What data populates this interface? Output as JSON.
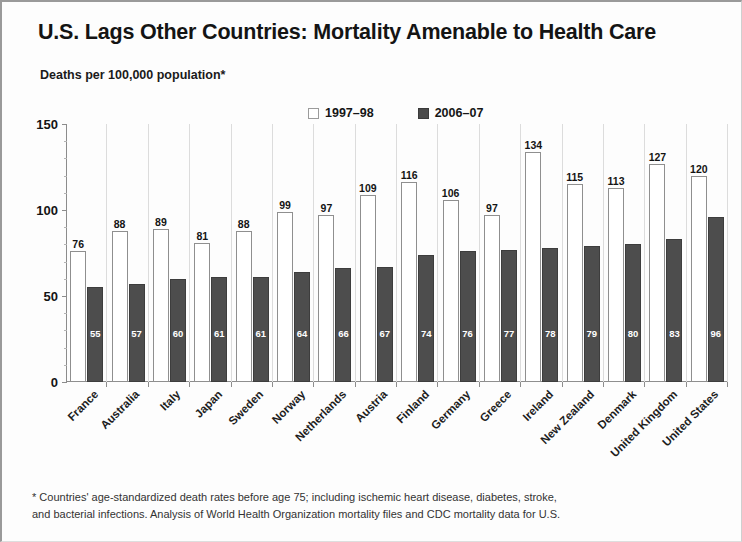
{
  "title": "U.S. Lags Other Countries: Mortality Amenable to Health Care",
  "axis_caption": "Deaths per 100,000 population*",
  "legend": {
    "items": [
      {
        "label": "1997–98",
        "swatch": "hollow-square-icon"
      },
      {
        "label": "2006–07",
        "swatch": "filled-square-icon"
      }
    ]
  },
  "footnote": {
    "line1": "* Countries' age-standardized death rates before age 75; including ischemic heart disease, diabetes, stroke,",
    "line2": "and bacterial infections. Analysis of World Health Organization mortality files and CDC mortality data for U.S."
  },
  "chart_data": {
    "type": "bar",
    "title": "U.S. Lags Other Countries: Mortality Amenable to Health Care",
    "subtitle": "Deaths per 100,000 population*",
    "xlabel": "",
    "ylabel": "Deaths per 100,000 population*",
    "ylim": [
      0,
      150
    ],
    "yticks": [
      0,
      50,
      100,
      150
    ],
    "grid": false,
    "legend_position": "top-center",
    "categories": [
      "France",
      "Australia",
      "Italy",
      "Japan",
      "Sweden",
      "Norway",
      "Netherlands",
      "Austria",
      "Finland",
      "Germany",
      "Greece",
      "Ireland",
      "New Zealand",
      "Denmark",
      "United Kingdom",
      "United States"
    ],
    "series": [
      {
        "name": "1997–98",
        "color": "#ffffff",
        "values": [
          76,
          88,
          89,
          81,
          88,
          99,
          97,
          109,
          116,
          106,
          97,
          134,
          115,
          113,
          127,
          120
        ]
      },
      {
        "name": "2006–07",
        "color": "#4d4d4d",
        "values": [
          55,
          57,
          60,
          61,
          61,
          64,
          66,
          67,
          74,
          76,
          77,
          78,
          79,
          80,
          83,
          96
        ]
      }
    ]
  }
}
